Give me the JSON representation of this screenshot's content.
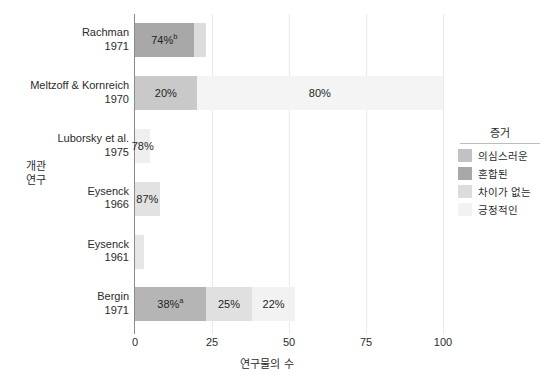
{
  "chart_data": {
    "type": "bar",
    "orientation": "horizontal",
    "stacked": true,
    "title": "",
    "xlabel": "연구물의 수",
    "ylabel": "개관\n연구",
    "xlim": [
      0,
      100
    ],
    "xticks": [
      0,
      25,
      50,
      75,
      100
    ],
    "xtick_labels": [
      "0",
      "25",
      "50",
      "75",
      "100"
    ],
    "grid": true,
    "grid_axis": "x",
    "legend": {
      "title": "증거",
      "position": "right",
      "entries": [
        {
          "label": "의심스러운",
          "color": "#c2c2c2"
        },
        {
          "label": "혼합된",
          "color": "#a8a8a8"
        },
        {
          "label": "차이가 없는",
          "color": "#dcdcdc"
        },
        {
          "label": "긍정적인",
          "color": "#f2f2f2"
        }
      ]
    },
    "categories": [
      "Rachman\n1971",
      "Meltzoff & Kornreich\n1970",
      "Luborsky et al.\n1975",
      "Eysenck\n1966",
      "Eysenck\n1961",
      "Bergin\n1971"
    ],
    "bars": [
      {
        "name": "Rachman 1971",
        "author": "Rachman",
        "year": "1971",
        "segments": [
          {
            "series": "혼합된",
            "value": 19,
            "label": "74%",
            "superscript": "b",
            "color": "#a8a8a8",
            "show_label": true
          },
          {
            "series": "차이가 없는",
            "value": 4,
            "label": "",
            "superscript": "",
            "color": "#dcdcdc",
            "show_label": false
          }
        ],
        "total": 23
      },
      {
        "name": "Meltzoff & Kornreich 1970",
        "author": "Meltzoff & Kornreich",
        "year": "1970",
        "segments": [
          {
            "series": "의심스러운",
            "value": 20,
            "label": "20%",
            "superscript": "",
            "color": "#c9c9c9",
            "show_label": true
          },
          {
            "series": "긍정적인",
            "value": 80,
            "label": "80%",
            "superscript": "",
            "color": "#f4f4f4",
            "show_label": true
          }
        ],
        "total": 100
      },
      {
        "name": "Luborsky et al. 1975",
        "author": "Luborsky et al.",
        "year": "1975",
        "segments": [
          {
            "series": "긍정적인",
            "value": 5,
            "label": "78%",
            "superscript": "",
            "color": "#efefef",
            "show_label": true
          }
        ],
        "total": 5
      },
      {
        "name": "Eysenck 1966",
        "author": "Eysenck",
        "year": "1966",
        "segments": [
          {
            "series": "차이가 없는",
            "value": 8,
            "label": "87%",
            "superscript": "",
            "color": "#e2e2e2",
            "show_label": true
          }
        ],
        "total": 8
      },
      {
        "name": "Eysenck 1961",
        "author": "Eysenck",
        "year": "1961",
        "segments": [
          {
            "series": "차이가 없는",
            "value": 3,
            "label": "",
            "superscript": "",
            "color": "#e6e6e6",
            "show_label": false
          }
        ],
        "total": 3
      },
      {
        "name": "Bergin 1971",
        "author": "Bergin",
        "year": "1971",
        "segments": [
          {
            "series": "혼합된",
            "value": 23,
            "label": "38%",
            "superscript": "a",
            "color": "#b5b5b5",
            "show_label": true
          },
          {
            "series": "차이가 없는",
            "value": 15,
            "label": "25%",
            "superscript": "",
            "color": "#e0e0e0",
            "show_label": true
          },
          {
            "series": "긍정적인",
            "value": 14,
            "label": "22%",
            "superscript": "",
            "color": "#f2f2f2",
            "show_label": true
          }
        ],
        "total": 52
      }
    ]
  },
  "style": {
    "axis_color": "#8a8a8a",
    "grid_color": "#e9e9e9",
    "text_color": "#2b2b2b",
    "background": "#ffffff"
  }
}
